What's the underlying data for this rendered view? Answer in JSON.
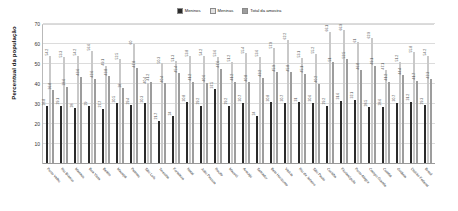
{
  "chart_data": {
    "type": "bar",
    "title": "",
    "xlabel": "",
    "ylabel": "Percentual da população",
    "ylim": [
      0,
      70
    ],
    "yticks": [
      10,
      20,
      30,
      40,
      50,
      60,
      70
    ],
    "grid": true,
    "legend_position": "top-center",
    "legend": [
      "Meninos",
      "Meninas",
      "Total da amostra"
    ],
    "colors": {
      "meninos": "#2b2b2b",
      "meninas": "#e2e2e2",
      "total": "#9d9d9d",
      "gridline": "#dcdcdc",
      "background": "#ffffff"
    },
    "categories": [
      "Porto Velho",
      "Rio Branco",
      "Manaus",
      "Boa Vista",
      "Belém",
      "Macapá",
      "Palmas",
      "São Luís",
      "Teresina",
      "Fortaleza",
      "Natal",
      "João Pessoa",
      "Recife",
      "Maceió",
      "Aracaju",
      "Salvador",
      "Belo Horizonte",
      "Vitória",
      "Rio de Janeiro",
      "São Paulo",
      "Curitiba",
      "Florianópolis",
      "Porto Alegre",
      "Campo Grande",
      "Cuiabá",
      "Goiânia",
      "Distrito Federal",
      "Brasil"
    ],
    "series": [
      {
        "name": "Meninos",
        "values": [
          28.8,
          29.1,
          28.0,
          29.0,
          27.7,
          30.5,
          29.4,
          30.3,
          21.7,
          24.0,
          30.8,
          29.2,
          37.5,
          29.2,
          30.7,
          24.0,
          30.8,
          30.7,
          31.0,
          30.6,
          29.2,
          31.6,
          32.1,
          28.5,
          28.6,
          30.7,
          31.2,
          29.3
        ]
      },
      {
        "name": "Meninas",
        "values": [
          54.2,
          53.3,
          54.2,
          56.6,
          49.1,
          52.5,
          60.0,
          40.4,
          50.3,
          51.3,
          53.8,
          54.2,
          53.6,
          51.2,
          55.4,
          53.6,
          57.9,
          62.2,
          53.1,
          55.2,
          66.1,
          66.9,
          61.0,
          62.9,
          47.1,
          51.2,
          55.8,
          54.2
        ]
      },
      {
        "name": "Total da amostra",
        "values": [
          36.8,
          38.6,
          43.6,
          42.6,
          43.8,
          38.0,
          47.8,
          41.2,
          40.4,
          45.4,
          41.2,
          40.6,
          47.6,
          41.2,
          40.8,
          43.2,
          45.9,
          45.8,
          45.1,
          40.2,
          51.0,
          52.5,
          46.8,
          49.1,
          41.2,
          44.4,
          41.7,
          42.3
        ]
      }
    ]
  }
}
